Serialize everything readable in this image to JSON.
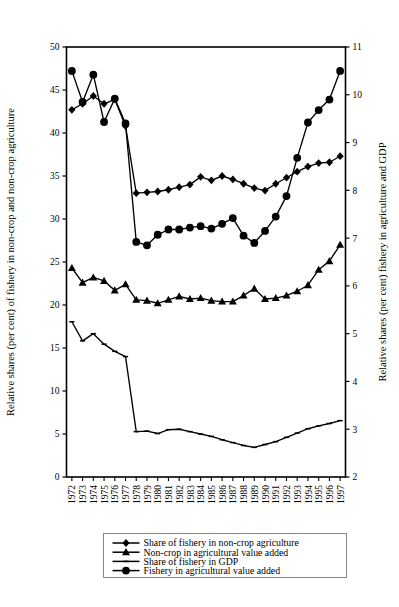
{
  "chart_data": {
    "type": "line",
    "title": "",
    "xlabel": "Financial year beginning July",
    "ylabel_left": "Relative shares  (per cent) of fishery in non-crop and non-crop agriculture",
    "ylabel_right": "Relative shares (per cent) fishery in agriculture and GDP",
    "grid": false,
    "legend_position": "bottom",
    "x": [
      1972,
      1973,
      1974,
      1975,
      1976,
      1977,
      1978,
      1979,
      1980,
      1981,
      1982,
      1983,
      1984,
      1985,
      1986,
      1987,
      1988,
      1989,
      1990,
      1991,
      1992,
      1993,
      1994,
      1995,
      1996,
      1997
    ],
    "xtick_labels": [
      "1972",
      "1973",
      "1974",
      "1975",
      "1976",
      "1977",
      "1978",
      "1979",
      "1980",
      "1981",
      "1982",
      "1983",
      "1984",
      "1985",
      "1986",
      "1987",
      "1988",
      "1989",
      "1990",
      "1991",
      "1992",
      "1993",
      "1994",
      "1995",
      "1996",
      "1997"
    ],
    "left_axis": {
      "min": 0,
      "max": 50,
      "ticks": [
        0,
        5,
        10,
        15,
        20,
        25,
        30,
        35,
        40,
        45,
        50
      ]
    },
    "right_axis": {
      "min": 2,
      "max": 11,
      "ticks": [
        2,
        3,
        4,
        5,
        6,
        7,
        8,
        9,
        10,
        11
      ]
    },
    "series": [
      {
        "name": "Share of fishery in non-crop agriculture",
        "marker": "diamond",
        "axis": "left",
        "values": [
          42.7,
          43.4,
          44.3,
          43.4,
          43.9,
          40.8,
          33.0,
          33.1,
          33.2,
          33.4,
          33.7,
          34.0,
          34.9,
          34.5,
          35.0,
          34.6,
          34.1,
          33.6,
          33.3,
          34.1,
          34.8,
          35.5,
          36.1,
          36.5,
          36.6,
          37.3
        ]
      },
      {
        "name": "Non-crop in agricultural value added",
        "marker": "triangle",
        "axis": "left",
        "values": [
          24.3,
          22.6,
          23.2,
          22.8,
          21.7,
          22.4,
          20.6,
          20.5,
          20.2,
          20.6,
          21.0,
          20.7,
          20.8,
          20.5,
          20.4,
          20.4,
          21.1,
          21.9,
          20.7,
          20.8,
          21.1,
          21.6,
          22.3,
          24.1,
          25.1,
          27.0
        ]
      },
      {
        "name": "Share of fishery in GDP",
        "marker": "none",
        "axis": "right",
        "values": [
          5.25,
          4.85,
          5.0,
          4.78,
          4.63,
          4.52,
          2.95,
          2.96,
          2.91,
          2.99,
          3.0,
          2.95,
          2.9,
          2.85,
          2.78,
          2.72,
          2.66,
          2.62,
          2.68,
          2.74,
          2.83,
          2.92,
          3.01,
          3.07,
          3.12,
          3.18
        ]
      },
      {
        "name": "Fishery in agricultural value added",
        "marker": "circle",
        "axis": "right",
        "values": [
          10.5,
          9.85,
          10.42,
          9.43,
          9.92,
          9.4,
          6.92,
          6.85,
          7.07,
          7.18,
          7.18,
          7.22,
          7.25,
          7.2,
          7.3,
          7.42,
          7.05,
          6.9,
          7.15,
          7.45,
          7.88,
          8.68,
          9.42,
          9.68,
          9.9,
          10.5
        ]
      }
    ],
    "legend": [
      {
        "label": "Share of fishery in non-crop agriculture",
        "marker": "diamond"
      },
      {
        "label": "Non-crop in agricultural value added",
        "marker": "triangle"
      },
      {
        "label": "Share of fishery in GDP",
        "marker": "none"
      },
      {
        "label": "Fishery in agricultural value added",
        "marker": "circle"
      }
    ],
    "colors": {
      "line": "#000000",
      "marker": "#000000",
      "axis": "#000000",
      "background": "#ffffff"
    }
  }
}
